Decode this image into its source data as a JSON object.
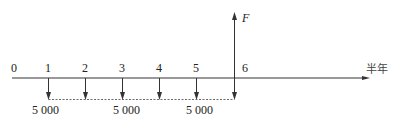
{
  "diagram": {
    "type": "cash-flow-timeline",
    "axis_unit_label": "半年",
    "period_labels": [
      "0",
      "1",
      "2",
      "3",
      "4",
      "5",
      "6"
    ],
    "outflow_periods": [
      1,
      2,
      3,
      4,
      5,
      6
    ],
    "outflow_amount_labels": [
      {
        "text": "5 000",
        "under_period": 1
      },
      {
        "text": "5 000",
        "under_period": 3
      },
      {
        "text": "5 000",
        "under_period": 5
      }
    ],
    "future_value": {
      "label": "F",
      "at_period": 6
    },
    "colors": {
      "line": "#333333",
      "text": "#222222",
      "background": "#ffffff"
    }
  }
}
